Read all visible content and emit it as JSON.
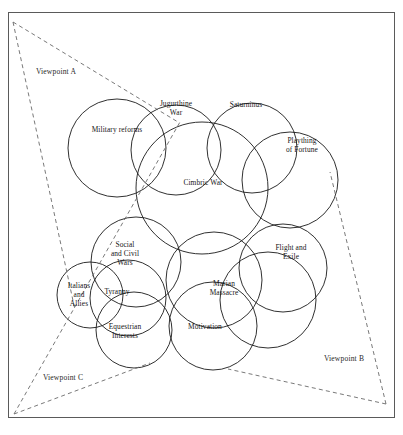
{
  "figure": {
    "type": "overlapping-circles-venn",
    "title": "",
    "frame": {
      "x": 8,
      "y": 12,
      "width": 387,
      "height": 406
    },
    "caption": ""
  },
  "circles": [
    {
      "id": "military-reforms",
      "label": "Military reforms",
      "cx": 117,
      "cy": 148,
      "r": 49,
      "label_x": 117,
      "label_y": 130
    },
    {
      "id": "jugurthine-war",
      "label": "Jugurthine\nWar",
      "cx": 176,
      "cy": 150,
      "r": 45,
      "label_x": 176,
      "label_y": 108
    },
    {
      "id": "saturninus",
      "label": "Saturninus",
      "cx": 252,
      "cy": 148,
      "r": 45,
      "label_x": 246,
      "label_y": 105
    },
    {
      "id": "plaything-of-fortune",
      "label": "Plaything\nof Fortune",
      "cx": 290,
      "cy": 180,
      "r": 48,
      "label_x": 302,
      "label_y": 145
    },
    {
      "id": "cimbric-war",
      "label": "Cimbric War",
      "cx": 202,
      "cy": 188,
      "r": 66,
      "label_x": 203,
      "label_y": 183
    },
    {
      "id": "flight-and-exile",
      "label": "Flight and\nExile",
      "cx": 283,
      "cy": 268,
      "r": 44,
      "label_x": 291,
      "label_y": 252
    },
    {
      "id": "social-and-civil-wars",
      "label": "Social\nand Civil\nWars",
      "cx": 136,
      "cy": 262,
      "r": 45,
      "label_x": 125,
      "label_y": 254
    },
    {
      "id": "italians-and-allies",
      "label": "Italians\nand\nAllies",
      "cx": 90,
      "cy": 295,
      "r": 33,
      "label_x": 79,
      "label_y": 295
    },
    {
      "id": "tyranny",
      "label": "Tyranny",
      "cx": 128,
      "cy": 298,
      "r": 38,
      "label_x": 117,
      "label_y": 292
    },
    {
      "id": "marian-massacre",
      "label": "Marian\nMassacre",
      "cx": 214,
      "cy": 280,
      "r": 48,
      "label_x": 224,
      "label_y": 288
    },
    {
      "id": "equestrian-interests",
      "label": "Equestrian\nInterests",
      "cx": 134,
      "cy": 330,
      "r": 38,
      "label_x": 125,
      "label_y": 331
    },
    {
      "id": "motivation",
      "label": "Motivation",
      "cx": 213,
      "cy": 326,
      "r": 44,
      "label_x": 205,
      "label_y": 327
    },
    {
      "id": "lower-right-circle",
      "label": "",
      "cx": 268,
      "cy": 300,
      "r": 48,
      "label_x": 0,
      "label_y": 0
    }
  ],
  "viewpoints": [
    {
      "id": "viewpoint-a",
      "label": "Viewpoint A",
      "label_x": 56,
      "label_y": 71,
      "apex_x": 13,
      "apex_y": 22,
      "ray1_x": 178,
      "ray1_y": 122,
      "ray2_x": 75,
      "ray2_y": 310
    },
    {
      "id": "viewpoint-b",
      "label": "Viewpoint B",
      "label_x": 344,
      "label_y": 358,
      "apex_x": 386,
      "apex_y": 404,
      "ray1_x": 330,
      "ray1_y": 172,
      "ray2_x": 228,
      "ray2_y": 369
    },
    {
      "id": "viewpoint-c",
      "label": "Viewpoint C",
      "label_x": 63,
      "label_y": 377,
      "apex_x": 14,
      "apex_y": 414,
      "ray1_x": 180,
      "ray1_y": 122,
      "ray2_x": 150,
      "ray2_y": 363
    }
  ],
  "colors": {
    "frame_stroke": "#5a5a5a",
    "circle_stroke": "#1a1a1a",
    "dashed_stroke": "#6a6a6a",
    "background": "#ffffff",
    "text": "#161616"
  }
}
